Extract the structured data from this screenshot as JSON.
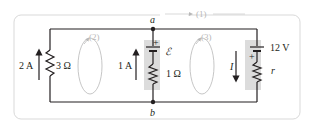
{
  "diagram": {
    "type": "circuit",
    "colors": {
      "wire": "#231f20",
      "frame": "#d9d9d9",
      "battery_highlight": "#dcdcdc",
      "loop": "#b8b8b8"
    },
    "nodes": {
      "top": "a",
      "bottom": "b"
    },
    "left_branch": {
      "current": "2 A",
      "resistance": "3 Ω"
    },
    "middle_branch": {
      "current": "1 A",
      "emf": "ℰ",
      "polarity": "+",
      "resistance": "1 Ω"
    },
    "right_branch": {
      "current": "I",
      "emf": "12 V",
      "polarity": "+",
      "resistance": "r"
    },
    "loops": {
      "outer": "(1)",
      "left": "(2)",
      "right": "(3)"
    }
  }
}
